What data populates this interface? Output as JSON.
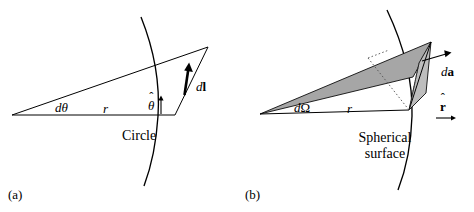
{
  "figure": {
    "background_color": "#ffffff",
    "stroke_color": "#000000",
    "shade_color": "#a6a6a6",
    "shade_color_light": "#bdbdbd"
  },
  "panel_a": {
    "tag": "(a)",
    "labels": {
      "d_theta": "dθ",
      "radius": "r",
      "theta_hat_base": "θ",
      "theta_hat_accent": "ˆ",
      "dl_d": "d",
      "dl_l": "l",
      "caption": "Circle"
    }
  },
  "panel_b": {
    "tag": "(b)",
    "labels": {
      "d_omega_d": "d",
      "d_omega_symbol": "Ω",
      "radius": "r",
      "da_d": "d",
      "da_a": "a",
      "r_hat_base": "r",
      "r_hat_accent": "ˆ",
      "caption_line1": "Spherical",
      "caption_line2": "surface"
    }
  }
}
